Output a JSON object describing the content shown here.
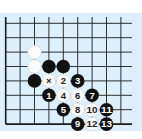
{
  "diagram": {
    "title": "",
    "board_color": "#dcEFFa",
    "line_color": "#1a1a1a",
    "grid": {
      "origin_x": 5.7,
      "origin_y": 23.3,
      "spacing": 14.4,
      "cols": 9,
      "rows": 8,
      "left_edge": true,
      "bottom_edge": true,
      "top_open": true,
      "right_open": true
    },
    "stones": [
      {
        "col": 2,
        "row": 2,
        "color": "white",
        "label": ""
      },
      {
        "col": 2,
        "row": 3,
        "color": "white",
        "label": ""
      },
      {
        "col": 3,
        "row": 3,
        "color": "black",
        "label": ""
      },
      {
        "col": 4,
        "row": 3,
        "color": "black",
        "label": ""
      },
      {
        "col": 2,
        "row": 4,
        "color": "black",
        "label": ""
      },
      {
        "col": 3,
        "row": 4,
        "color": "white",
        "label": "×"
      },
      {
        "col": 4,
        "row": 4,
        "color": "white",
        "label": "2"
      },
      {
        "col": 5,
        "row": 4,
        "color": "black",
        "label": "3"
      },
      {
        "col": 3,
        "row": 5,
        "color": "black",
        "label": "1"
      },
      {
        "col": 4,
        "row": 5,
        "color": "white",
        "label": "4"
      },
      {
        "col": 5,
        "row": 5,
        "color": "white",
        "label": "6"
      },
      {
        "col": 6,
        "row": 5,
        "color": "black",
        "label": "7"
      },
      {
        "col": 4,
        "row": 6,
        "color": "black",
        "label": "5"
      },
      {
        "col": 5,
        "row": 6,
        "color": "white",
        "label": "8"
      },
      {
        "col": 6,
        "row": 6,
        "color": "white",
        "label": "10"
      },
      {
        "col": 7,
        "row": 6,
        "color": "black",
        "label": "11"
      },
      {
        "col": 5,
        "row": 7,
        "color": "black",
        "label": "9"
      },
      {
        "col": 6,
        "row": 7,
        "color": "white",
        "label": "12"
      },
      {
        "col": 7,
        "row": 7,
        "color": "black",
        "label": "13"
      }
    ]
  }
}
